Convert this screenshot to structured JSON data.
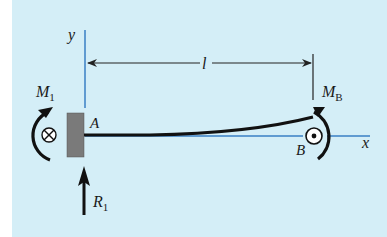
{
  "diagram": {
    "colors": {
      "background": "#d4eef7",
      "axis": "#3a7fc4",
      "beam": "#111111",
      "wall": "#7a7a7a",
      "dimension": "#222222"
    },
    "labels": {
      "y_axis": "y",
      "x_axis": "x",
      "length": "l",
      "moment_left": "M",
      "moment_left_sub": "1",
      "moment_right": "M",
      "moment_right_sub": "B",
      "point_a": "A",
      "point_b": "B",
      "reaction": "R",
      "reaction_sub": "1"
    },
    "symbols": {
      "left_vector": "into-page (⊗)",
      "right_vector": "out-of-page (⊙)"
    }
  }
}
